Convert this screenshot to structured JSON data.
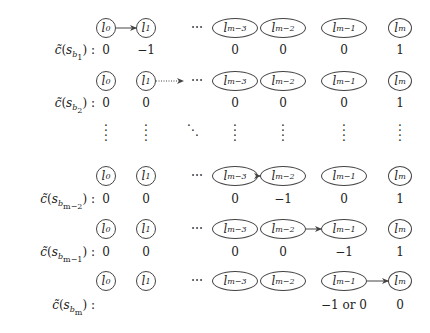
{
  "columns": {
    "nodes": [
      "l_0",
      "l_1",
      "⋯",
      "l_{m-3}",
      "l_{m-2}",
      "l_{m-1}",
      "l_m"
    ],
    "node_display": [
      {
        "base": "l",
        "sub": "0"
      },
      {
        "base": "l",
        "sub": "1"
      },
      {
        "base": "⋯",
        "sub": ""
      },
      {
        "base": "l",
        "sub": "m−3"
      },
      {
        "base": "l",
        "sub": "m−2"
      },
      {
        "base": "l",
        "sub": "m−1"
      },
      {
        "base": "l",
        "sub": "m"
      }
    ]
  },
  "rows": [
    {
      "label_prefix": "c̃(s",
      "label_sub": "b",
      "label_subsub": "1",
      "label_suffix": ") :",
      "arrow": {
        "from": "l_0",
        "to": "l_1",
        "style": "solid"
      },
      "values": [
        "0",
        "−1",
        "",
        "0",
        "0",
        "0",
        "1"
      ]
    },
    {
      "label_prefix": "c̃(s",
      "label_sub": "b",
      "label_subsub": "2",
      "label_suffix": ") :",
      "arrow": {
        "from": "l_1",
        "to": "⋯",
        "style": "dotted"
      },
      "values": [
        "0",
        "0",
        "",
        "0",
        "0",
        "0",
        "1"
      ]
    },
    {
      "label_prefix": "c̃(s",
      "label_sub": "b",
      "label_subsub": "m−2",
      "label_suffix": ") :",
      "arrow": {
        "from": "l_{m-3}",
        "to": "l_{m-2}",
        "style": "solid"
      },
      "values": [
        "0",
        "0",
        "",
        "0",
        "−1",
        "0",
        "1"
      ]
    },
    {
      "label_prefix": "c̃(s",
      "label_sub": "b",
      "label_subsub": "m−1",
      "label_suffix": ") :",
      "arrow": {
        "from": "l_{m-2}",
        "to": "l_{m-1}",
        "style": "solid"
      },
      "values": [
        "0",
        "0",
        "",
        "0",
        "0",
        "−1",
        "1"
      ]
    },
    {
      "label_prefix": "c̃(s",
      "label_sub": "b",
      "label_subsub": "m",
      "label_suffix": ") :",
      "arrow": {
        "from": "l_{m-1}",
        "to": "l_m",
        "style": "solid"
      },
      "values": [
        "",
        "",
        "",
        "",
        "",
        "−1 or 0",
        "0"
      ]
    }
  ],
  "ellipsis": {
    "horizontal": "⋯",
    "vertical": "⋮",
    "diagonal": "⋱"
  }
}
